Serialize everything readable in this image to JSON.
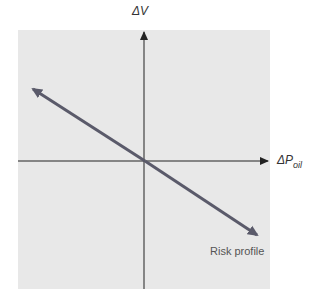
{
  "diagram": {
    "y_axis_label": "ΔV",
    "x_axis_label_main": "ΔP",
    "x_axis_label_sub": "oil",
    "line_label": "Risk profile",
    "colors": {
      "panel": "#e8e8e8",
      "axes": "#222222",
      "risk_line": "#5a5a6a"
    }
  }
}
